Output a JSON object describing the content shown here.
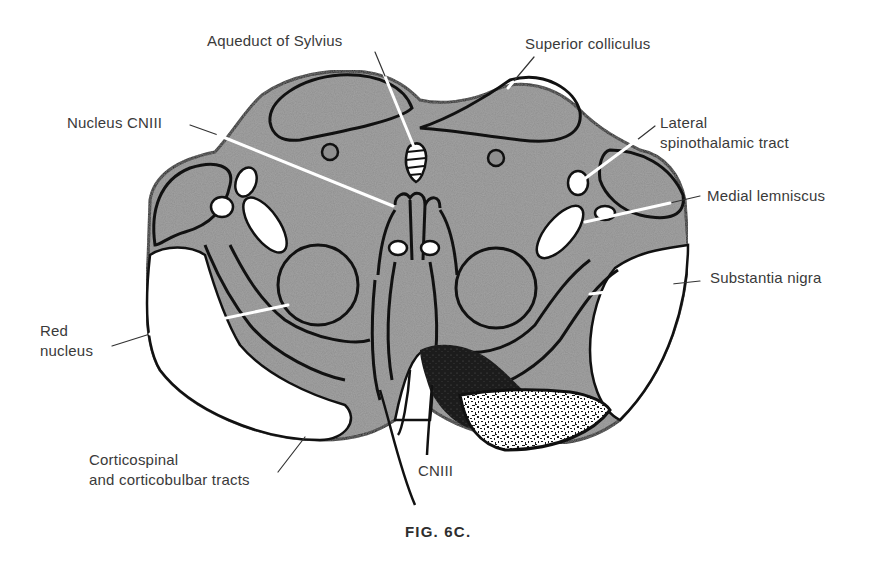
{
  "figure": {
    "caption": "FIG. 6C.",
    "colors": {
      "tissue_gray": "#8f8f8f",
      "outline": "#111111",
      "white_matter": "#ffffff",
      "lesion_dark": "#1a1a1a",
      "label_text": "#3a3a3a",
      "leader_white": "#ffffff"
    }
  },
  "labels": {
    "aqueduct": "Aqueduct of Sylvius",
    "superior_colliculus": "Superior colliculus",
    "nucleus_cn3": "Nucleus CNIII",
    "lateral_st_line1": "Lateral",
    "lateral_st_line2": "spinothalamic tract",
    "medial_lemniscus": "Medial lemniscus",
    "substantia_nigra": "Substantia nigra",
    "red_nucleus_line1": "Red",
    "red_nucleus_line2": "nucleus",
    "corticospinal_line1": "Corticospinal",
    "corticospinal_line2": "and corticobulbar tracts",
    "cn3": "CNIII"
  }
}
